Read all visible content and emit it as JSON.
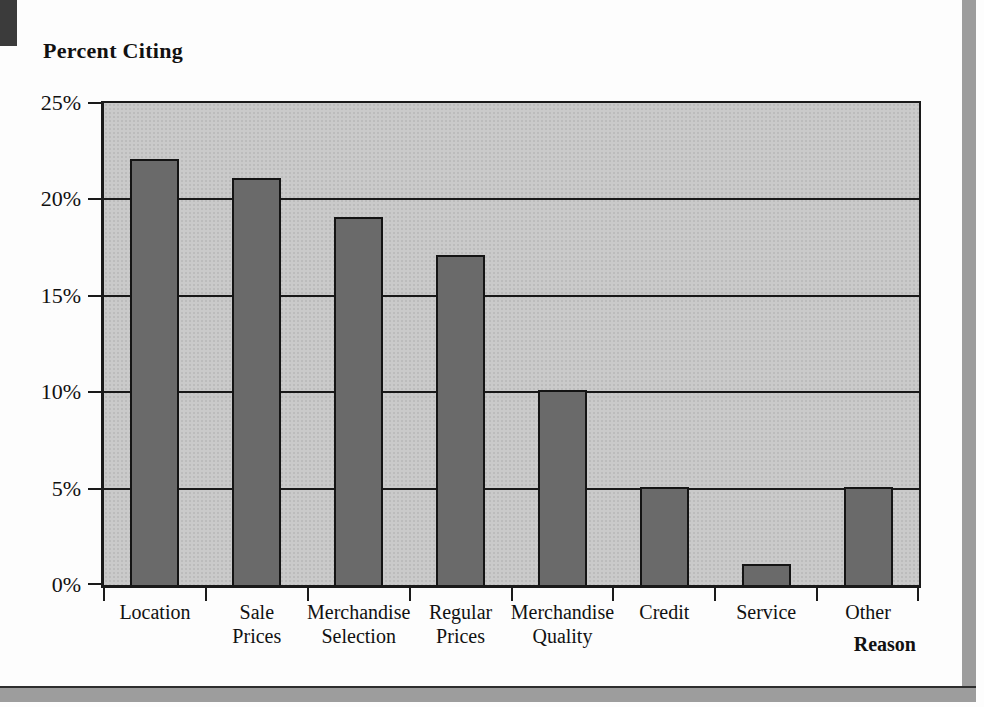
{
  "chart_data": {
    "type": "bar",
    "title": "",
    "ylabel": "Percent Citing",
    "xlabel": "Reason",
    "categories": [
      "Location",
      "Sale Prices",
      "Merchandise Selection",
      "Regular Prices",
      "Merchandise Quality",
      "Credit",
      "Service",
      "Other"
    ],
    "values": [
      22,
      21,
      19,
      17,
      10,
      5,
      1,
      5
    ],
    "ylim": [
      0,
      25
    ],
    "yticks": [
      0,
      5,
      10,
      15,
      20,
      25
    ],
    "ytick_labels": [
      "0%",
      "5%",
      "10%",
      "15%",
      "20%",
      "25%"
    ],
    "grid": true,
    "legend": null,
    "bar_color": "#6a6a6a",
    "plot_bg": "#cacaca"
  },
  "colors": {
    "corner_tab": "#3b3b3b",
    "frame_gray": "#9d9d9d",
    "axis": "#1a1a1a"
  }
}
